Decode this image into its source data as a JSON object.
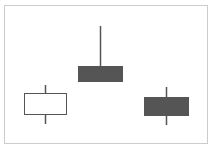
{
  "chart_data": {
    "type": "candlestick",
    "title": "",
    "xlabel": "",
    "ylabel": "",
    "grid": false,
    "legend": null,
    "frame": {
      "x": 4,
      "y": 5,
      "width": 203,
      "height": 138,
      "border_color": "#cccccc"
    },
    "colors": {
      "bullish_fill": "#ffffff",
      "bearish_fill": "#555555",
      "outline": "#555555",
      "wick": "#555555"
    },
    "candles": [
      {
        "index": 1,
        "direction": "bullish",
        "body": {
          "x": 24,
          "y": 93,
          "width": 42,
          "height": 21
        },
        "wick": {
          "x": 45,
          "y_top": 85,
          "y_bottom": 124
        }
      },
      {
        "index": 2,
        "direction": "bearish",
        "body": {
          "x": 78,
          "y": 66,
          "width": 44,
          "height": 15
        },
        "wick": {
          "x": 100,
          "y_top": 26,
          "y_bottom": 81
        }
      },
      {
        "index": 3,
        "direction": "bearish",
        "body": {
          "x": 144,
          "y": 97,
          "width": 44,
          "height": 18
        },
        "wick": {
          "x": 166,
          "y_top": 87,
          "y_bottom": 125
        }
      }
    ]
  }
}
